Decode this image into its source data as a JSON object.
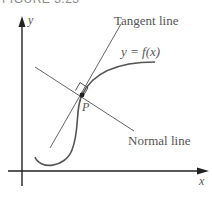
{
  "figure": {
    "title": "FIGURE 3.23",
    "labels": {
      "y_axis": "y",
      "x_axis": "x",
      "tangent": "Tangent line",
      "curve": "y = f(x)",
      "point": "P",
      "normal": "Normal line"
    },
    "colors": {
      "axes": "#222222",
      "curve": "#555555",
      "lines": "#666666",
      "text": "#555555"
    }
  }
}
